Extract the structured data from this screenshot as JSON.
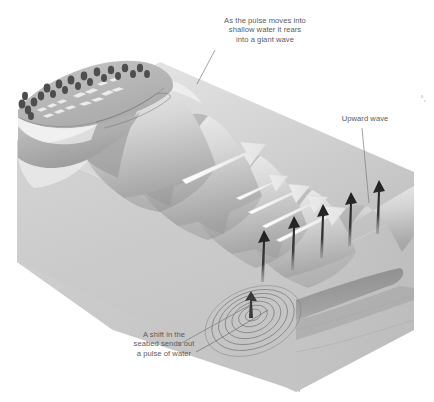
{
  "illustration": {
    "title": "Tsunami formation cutaway block diagram",
    "type": "cross-section perspective illustration",
    "palette": {
      "background": "#ffffff",
      "block_left_face": "#d9d9d9",
      "block_front_face": "#cfcfcf",
      "block_right_face": "#c2c2c2",
      "water_surface_light": "#e6e6e6",
      "water_surface_mid": "#c9c9c9",
      "water_surface_dark": "#9c9c9c",
      "seabed_shadow": "#8d8d8d",
      "land_top": "#b9b9b9",
      "beach_highlight": "#f2f2f2",
      "tree_dark": "#4a4a4a",
      "arrow_up_dark": "#2b2b2b",
      "arrow_flow_white": "#f4f4f4",
      "ripple_line": "#6f6f6f",
      "leader_line": "#7a7a7a",
      "text": "#5b5b5b"
    }
  },
  "callouts": [
    {
      "id": "shallow-water",
      "text": "As the pulse moves into\nshallow water it rears\ninto a giant wave",
      "leader_from": [
        215,
        50
      ],
      "leader_to": [
        197,
        84
      ]
    },
    {
      "id": "upward-wave",
      "text": "Upward wave",
      "leader_from": [
        362,
        128
      ],
      "leader_to": [
        369,
        203
      ]
    },
    {
      "id": "seabed-shift",
      "text": "A shift in the\nseabed sends out\na pulse of water",
      "leader_from": [
        178,
        345
      ],
      "leader_to": [
        250,
        304
      ]
    }
  ],
  "features": {
    "upward_arrows": {
      "name": "upward-wave-arrows",
      "count": 5,
      "description": "Dark vertical arrows rising from the seabed fault to the sea surface"
    },
    "flow_arrows": {
      "name": "wave-direction-arrows",
      "count": 5,
      "description": "White arrows on the sea surface pointing toward the shore"
    },
    "ripples": {
      "name": "seabed-pulse-ripples",
      "count": 7,
      "description": "Concentric elliptical ripples radiating from the seabed shift point"
    },
    "wave_crests": {
      "name": "wave-crests",
      "count": 5,
      "description": "Rolling swells growing taller as they approach the shallow shoreline"
    },
    "coastline": {
      "name": "coastal-town",
      "trees": 22,
      "buildings": 14,
      "description": "Forested headland with small buildings above a pale beach"
    }
  }
}
